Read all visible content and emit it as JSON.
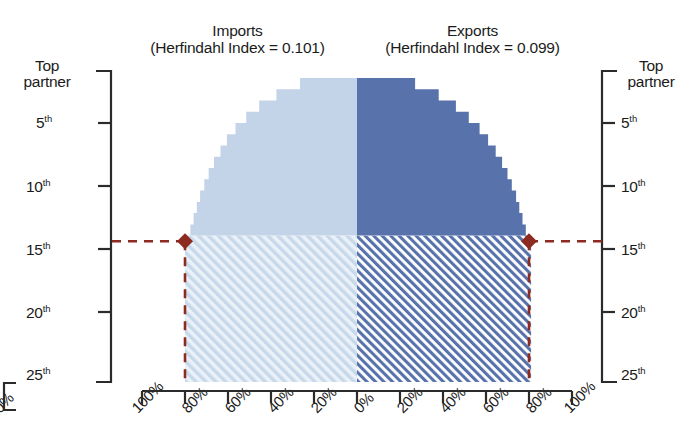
{
  "titles": {
    "imports_line1": "Imports",
    "imports_line2": "(Herfindahl Index = 0.101)",
    "exports_line1": "Exports",
    "exports_line2": "(Herfindahl Index = 0.099)"
  },
  "axes": {
    "y_left": {
      "top_label_line1": "Top",
      "top_label_line2": "partner",
      "ticks": [
        "5",
        "10",
        "15",
        "20",
        "25"
      ],
      "suffix": "th"
    },
    "y_right": {
      "top_label_line1": "Top",
      "top_label_line2": "partner",
      "ticks": [
        "5",
        "10",
        "15",
        "20",
        "25"
      ],
      "suffix": "th"
    },
    "x_ticks": [
      "100%",
      "80%",
      "60%",
      "40%",
      "20%",
      "0%",
      "20%",
      "40%",
      "60%",
      "80%",
      "100%"
    ],
    "clipped_left_label": "0%"
  },
  "colors": {
    "imports_fill": "#c3d3e8",
    "imports_hatch_bg": "#e8eff7",
    "imports_hatch_line": "#b9cde4",
    "exports_fill": "#5873ab",
    "exports_hatch_bg": "#ffffff",
    "exports_hatch_line": "#5873ab",
    "marker": "#8d2b21",
    "axis": "#2b2b2b"
  },
  "markers": {
    "left": {
      "rank": 15,
      "percent": 80
    },
    "right": {
      "rank": 15,
      "percent": 80
    }
  },
  "chart_data": {
    "type": "area",
    "subtitle": "",
    "xlabel": "",
    "ylabel": "Partner rank",
    "grid": false,
    "legend_position": "top",
    "orientation": "mirrored-horizontal",
    "note": "Tornado/back-to-back cumulative distribution. Left half = Imports (axis runs 100% at far left to 0% at center). Right half = Exports (0% at center to 100% at far right). Y axis = partner rank, Top partner at top to 25th at bottom. Solid fill = ranks 1-15; hatched fill = ranks 15-25+.",
    "ylim": [
      1,
      27
    ],
    "ytick_values": [
      1,
      5,
      10,
      15,
      20,
      25
    ],
    "ytick_labels": [
      "Top partner",
      "5th",
      "10th",
      "15th",
      "20th",
      "25th"
    ],
    "xlim": [
      -100,
      100
    ],
    "xtick_values": [
      -100,
      -80,
      -60,
      -40,
      -20,
      0,
      20,
      40,
      60,
      80,
      100
    ],
    "xtick_labels": [
      "100%",
      "80%",
      "60%",
      "40%",
      "20%",
      "0%",
      "20%",
      "40%",
      "60%",
      "80%",
      "100%"
    ],
    "solid_boundary_rank": 15,
    "series": [
      {
        "name": "Imports",
        "herfindahl_index": 0.101,
        "side": "left",
        "ranks": [
          1,
          2,
          3,
          4,
          5,
          6,
          7,
          8,
          9,
          10,
          11,
          12,
          13,
          14,
          15,
          16,
          17,
          18,
          19,
          20,
          21,
          22,
          23,
          24,
          25,
          26,
          27
        ],
        "cumulative_share_percent": [
          26.5,
          37.5,
          45.5,
          51.5,
          56.5,
          60.5,
          63.5,
          66.5,
          69.0,
          71.0,
          73.0,
          74.5,
          76.0,
          77.5,
          79.0,
          80.0,
          80.0,
          80.0,
          80.0,
          80.0,
          80.0,
          80.0,
          80.0,
          80.0,
          80.0,
          80.0,
          80.0
        ]
      },
      {
        "name": "Exports",
        "herfindahl_index": 0.099,
        "side": "right",
        "ranks": [
          1,
          2,
          3,
          4,
          5,
          6,
          7,
          8,
          9,
          10,
          11,
          12,
          13,
          14,
          15,
          16,
          17,
          18,
          19,
          20,
          21,
          22,
          23,
          24,
          25,
          26,
          27
        ],
        "cumulative_share_percent": [
          27.0,
          38.0,
          46.0,
          52.0,
          57.0,
          61.0,
          64.5,
          67.5,
          70.0,
          72.0,
          74.0,
          75.5,
          77.0,
          78.5,
          80.0,
          81.0,
          81.0,
          81.0,
          81.0,
          81.0,
          81.0,
          81.0,
          81.0,
          81.0,
          81.0,
          81.0,
          81.0
        ]
      }
    ],
    "annotations": [
      {
        "label": "Imports marker",
        "rank": 15,
        "percent": 80,
        "side": "left",
        "style": "diamond + dashed leader lines"
      },
      {
        "label": "Exports marker",
        "rank": 15,
        "percent": 80,
        "side": "right",
        "style": "diamond + dashed leader lines"
      }
    ]
  }
}
